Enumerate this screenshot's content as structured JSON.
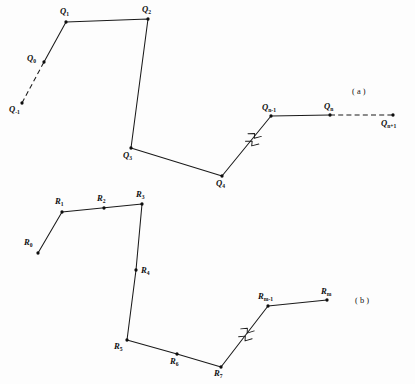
{
  "figure": {
    "background_color": "#fdfdfd",
    "line_color": "#1a1a1a",
    "dot_color": "#0d0d0d",
    "width": 415,
    "height": 384,
    "panels": [
      {
        "id": "panel-a",
        "caption": "( a )",
        "caption_x": 352,
        "caption_y": 88,
        "vertices": [
          {
            "name": "Q-minus-1",
            "base": "Q",
            "sub": "-1",
            "x": 22,
            "y": 103,
            "label_x": 9,
            "label_y": 105,
            "dot": true
          },
          {
            "name": "Q-0",
            "base": "Q",
            "sub": "0",
            "x": 44,
            "y": 62,
            "label_x": 27,
            "label_y": 54,
            "dot": true
          },
          {
            "name": "Q-1",
            "base": "Q",
            "sub": "1",
            "x": 66,
            "y": 22,
            "label_x": 60,
            "label_y": 7,
            "dot": true
          },
          {
            "name": "Q-2",
            "base": "Q",
            "sub": "2",
            "x": 148,
            "y": 19,
            "label_x": 142,
            "label_y": 5,
            "dot": true
          },
          {
            "name": "Q-3",
            "base": "Q",
            "sub": "3",
            "x": 131,
            "y": 148,
            "label_x": 123,
            "label_y": 151,
            "dot": true
          },
          {
            "name": "Q-4",
            "base": "Q",
            "sub": "4",
            "x": 222,
            "y": 176,
            "label_x": 216,
            "label_y": 179,
            "dot": true
          },
          {
            "name": "Q-n-minus-1",
            "base": "Q",
            "sub": "n-1",
            "x": 271,
            "y": 116,
            "label_x": 262,
            "label_y": 103,
            "dot": true
          },
          {
            "name": "Q-n",
            "base": "Q",
            "sub": "n",
            "x": 330,
            "y": 115,
            "label_x": 324,
            "label_y": 102,
            "dot": true
          },
          {
            "name": "Q-n-plus-1",
            "base": "Q",
            "sub": "n+1",
            "x": 393,
            "y": 115,
            "label_x": 381,
            "label_y": 119,
            "dot": true
          }
        ],
        "solid_path": "66,22 148,19 131,148 222,176 271,116 330,115",
        "solid_path_extra": "44,62 66,22",
        "dashed_segments": [
          {
            "name": "dashed-left",
            "x1": 22,
            "y1": 103,
            "x2": 44,
            "y2": 62
          },
          {
            "name": "dashed-right",
            "x1": 330,
            "y1": 115,
            "x2": 393,
            "y2": 115
          }
        ],
        "break_mark": {
          "name": "break-mark-a",
          "x": 252,
          "y": 139
        }
      },
      {
        "id": "panel-b",
        "caption": "( b )",
        "caption_x": 355,
        "caption_y": 297,
        "vertices": [
          {
            "name": "R-0",
            "base": "R",
            "sub": "0",
            "x": 38,
            "y": 253,
            "label_x": 24,
            "label_y": 238,
            "dot": true
          },
          {
            "name": "R-1",
            "base": "R",
            "sub": "1",
            "x": 62,
            "y": 212,
            "label_x": 55,
            "label_y": 197,
            "dot": true
          },
          {
            "name": "R-2",
            "base": "R",
            "sub": "2",
            "x": 104,
            "y": 208,
            "label_x": 97,
            "label_y": 194,
            "dot": true
          },
          {
            "name": "R-3",
            "base": "R",
            "sub": "3",
            "x": 142,
            "y": 204,
            "label_x": 136,
            "label_y": 190,
            "dot": true
          },
          {
            "name": "R-4",
            "base": "R",
            "sub": "4",
            "x": 136,
            "y": 270,
            "label_x": 141,
            "label_y": 266,
            "dot": true
          },
          {
            "name": "R-5",
            "base": "R",
            "sub": "5",
            "x": 127,
            "y": 340,
            "label_x": 114,
            "label_y": 342,
            "dot": true
          },
          {
            "name": "R-6",
            "base": "R",
            "sub": "6",
            "x": 177,
            "y": 354,
            "label_x": 170,
            "label_y": 357,
            "dot": true
          },
          {
            "name": "R-7",
            "base": "R",
            "sub": "7",
            "x": 221,
            "y": 367,
            "label_x": 214,
            "label_y": 369,
            "dot": true
          },
          {
            "name": "R-m-minus-1",
            "base": "R",
            "sub": "m-1",
            "x": 268,
            "y": 306,
            "label_x": 258,
            "label_y": 292,
            "dot": true
          },
          {
            "name": "R-m",
            "base": "R",
            "sub": "m",
            "x": 327,
            "y": 300,
            "label_x": 321,
            "label_y": 287,
            "dot": true
          }
        ],
        "solid_path": "38,253 62,212 142,204 136,270 127,340 177,354 221,367 268,306 327,300",
        "dashed_segments": [],
        "break_mark": {
          "name": "break-mark-b",
          "x": 245,
          "y": 334
        }
      }
    ]
  }
}
